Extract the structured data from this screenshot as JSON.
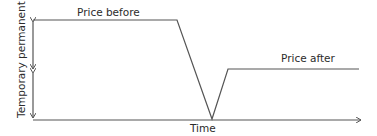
{
  "diagram": {
    "type": "price-timeline",
    "labels": {
      "price_before": "Price before",
      "price_after": "Price after",
      "x_axis": "Time",
      "y_axis": "Temporary permanent"
    },
    "colors": {
      "line": "#555555",
      "text": "#2b2b2b",
      "background": "#ffffff"
    },
    "path_points": [
      {
        "x": 33,
        "y": 20
      },
      {
        "x": 177,
        "y": 20
      },
      {
        "x": 212,
        "y": 119
      },
      {
        "x": 228,
        "y": 69
      },
      {
        "x": 359,
        "y": 69
      }
    ],
    "axis": {
      "origin": {
        "x": 33,
        "y": 120
      },
      "x_end": 360,
      "y_top": 20,
      "y_mid_marker": 71
    }
  }
}
